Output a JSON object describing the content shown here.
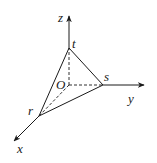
{
  "diagram": {
    "type": "3d-coordinate-tetrahedron",
    "axes": {
      "x": {
        "label": "x"
      },
      "y": {
        "label": "y"
      },
      "z": {
        "label": "z"
      }
    },
    "origin": {
      "label": "O"
    },
    "vertices": {
      "r": {
        "label": "r",
        "on_axis": "x"
      },
      "s": {
        "label": "s",
        "on_axis": "y"
      },
      "t": {
        "label": "t",
        "on_axis": "z"
      }
    },
    "solid_edges": [
      "t-r",
      "t-s",
      "r-s"
    ],
    "dashed_edges": [
      "O-t",
      "O-s",
      "O-r"
    ],
    "colors": {
      "stroke": "#1a1a1a",
      "background": "#ffffff"
    }
  }
}
